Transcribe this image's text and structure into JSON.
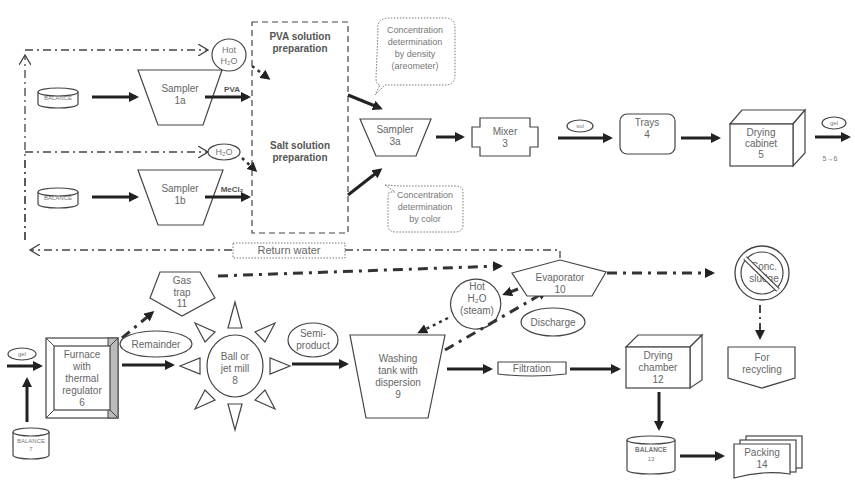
{
  "diagram": {
    "top_row": {
      "balance_1": "BALANCE",
      "balance_2": "BALANCE",
      "sampler_1a": [
        "Sampler",
        "1a"
      ],
      "sampler_1b": [
        "Sampler",
        "1b"
      ],
      "hot_water_1": [
        "Hot",
        "H₂O"
      ],
      "water_2": "H₂O",
      "pva_label": "PVA",
      "mecl_label": "MeCl₂",
      "pva_prep": [
        "PVA solution",
        "preparation"
      ],
      "salt_prep": [
        "Salt solution",
        "preparation"
      ],
      "callout_density": [
        "Concentration",
        "determination",
        "by density",
        "(areometer)"
      ],
      "callout_color": [
        "Concentration",
        "determination",
        "by color"
      ],
      "sampler_3a": [
        "Sampler",
        "3a"
      ],
      "mixer": [
        "Mixer",
        "3"
      ],
      "sol_tag": "sol",
      "trays": [
        "Trays",
        "4"
      ],
      "drying_cabinet": [
        "Drying",
        "cabinet",
        "5"
      ],
      "gel_tag_out": "gel",
      "flow_note": "5→6"
    },
    "return_water": "Return water",
    "bottom_row": {
      "gel_tag_in": "gel",
      "balance_7": [
        "BALANCE",
        "7"
      ],
      "furnace": [
        "Furnace",
        "with",
        "thermal",
        "regulator",
        "6"
      ],
      "gas_trap": [
        "Gas",
        "trap",
        "11"
      ],
      "remainder": "Remainder",
      "mill": [
        "Ball or",
        "jet mill",
        "8"
      ],
      "semi_product": [
        "Semi-",
        "product"
      ],
      "washing_tank": [
        "Washing",
        "tank with",
        "dispersion",
        "9"
      ],
      "hot_steam": [
        "Hot",
        "H₂O",
        "(steam)"
      ],
      "evaporator": [
        "Evaporator",
        "10"
      ],
      "discharge": "Discharge",
      "filtration": "Filtration",
      "conc_sludge": [
        "Conc.",
        "sludge"
      ],
      "for_recycling": [
        "For",
        "recycling"
      ],
      "drying_chamber": [
        "Drying",
        "chamber",
        "12"
      ],
      "balance_13": [
        "BALANCE",
        "13"
      ],
      "packing": [
        "Packing",
        "14"
      ]
    }
  }
}
